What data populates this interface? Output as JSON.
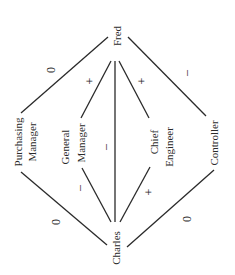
{
  "diagram": {
    "type": "signed-relationship-graph",
    "nodes": {
      "fred": {
        "label": "Fred"
      },
      "charles": {
        "label": "Charles"
      },
      "purchasing_manager": {
        "line1": "Purchasing",
        "line2": "Manager"
      },
      "general_manager": {
        "line1": "General",
        "line2": "Manager"
      },
      "chief_engineer": {
        "line1": "Chief",
        "line2": "Engineer"
      },
      "controller": {
        "label": "Controller"
      }
    },
    "edges": [
      {
        "from": "Fred",
        "to": "Purchasing Manager",
        "sign": "0"
      },
      {
        "from": "Fred",
        "to": "General Manager",
        "sign": "+"
      },
      {
        "from": "Fred",
        "to": "Charles",
        "sign": "–"
      },
      {
        "from": "Fred",
        "to": "Chief Engineer",
        "sign": "+"
      },
      {
        "from": "Fred",
        "to": "Controller",
        "sign": "–"
      },
      {
        "from": "Purchasing Manager",
        "to": "Charles",
        "sign": "0"
      },
      {
        "from": "General Manager",
        "to": "Charles",
        "sign": "–"
      },
      {
        "from": "Chief Engineer",
        "to": "Charles",
        "sign": "+"
      },
      {
        "from": "Controller",
        "to": "Charles",
        "sign": "0"
      }
    ]
  }
}
